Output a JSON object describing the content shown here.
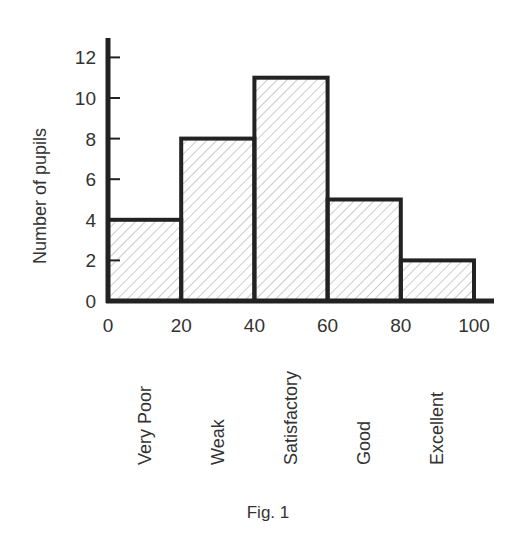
{
  "chart_data": {
    "type": "bar",
    "subtype": "histogram",
    "bins": [
      {
        "from": 0,
        "to": 20,
        "value": 4,
        "category": "Very Poor"
      },
      {
        "from": 20,
        "to": 40,
        "value": 8,
        "category": "Weak"
      },
      {
        "from": 40,
        "to": 60,
        "value": 11,
        "category": "Satisfactory"
      },
      {
        "from": 60,
        "to": 80,
        "value": 5,
        "category": "Good"
      },
      {
        "from": 80,
        "to": 100,
        "value": 2,
        "category": "Excellent"
      }
    ],
    "categories": [
      "Very Poor",
      "Weak",
      "Satisfactory",
      "Good",
      "Excellent"
    ],
    "values": [
      4,
      8,
      11,
      5,
      2
    ],
    "title": "",
    "caption": "Fig. 1",
    "xlabel": "",
    "ylabel": "Number of pupils",
    "xlim": [
      0,
      100
    ],
    "ylim": [
      0,
      13
    ],
    "xticks": [
      "0",
      "20",
      "40",
      "60",
      "80",
      "100"
    ],
    "yticks": [
      "0",
      "2",
      "4",
      "6",
      "8",
      "10",
      "12"
    ],
    "grid": false,
    "legend": "none",
    "fill_pattern": "diagonal-hatch",
    "colors": {
      "stroke": "#222222",
      "hatch": "#9a9a9a",
      "text": "#333333"
    }
  }
}
